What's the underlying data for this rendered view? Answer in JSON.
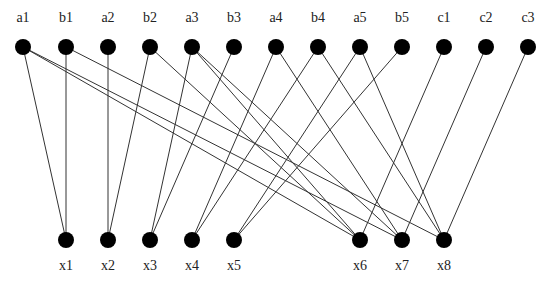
{
  "diagram": {
    "type": "bipartite-graph",
    "node_radius": 8,
    "colors": {
      "node": "#000000",
      "edge": "#333333",
      "label": "#222222",
      "background": "#ffffff"
    },
    "top_row": {
      "y": 47,
      "label_y": 22,
      "nodes": [
        {
          "id": "a1",
          "label": "a1",
          "x": 23
        },
        {
          "id": "b1",
          "label": "b1",
          "x": 66
        },
        {
          "id": "a2",
          "label": "a2",
          "x": 108
        },
        {
          "id": "b2",
          "label": "b2",
          "x": 150
        },
        {
          "id": "a3",
          "label": "a3",
          "x": 192
        },
        {
          "id": "b3",
          "label": "b3",
          "x": 234
        },
        {
          "id": "a4",
          "label": "a4",
          "x": 276
        },
        {
          "id": "b4",
          "label": "b4",
          "x": 318
        },
        {
          "id": "a5",
          "label": "a5",
          "x": 360
        },
        {
          "id": "b5",
          "label": "b5",
          "x": 402
        },
        {
          "id": "c1",
          "label": "c1",
          "x": 444
        },
        {
          "id": "c2",
          "label": "c2",
          "x": 486
        },
        {
          "id": "c3",
          "label": "c3",
          "x": 528
        }
      ]
    },
    "bottom_row": {
      "y": 240,
      "label_y": 270,
      "nodes": [
        {
          "id": "x1",
          "label": "x1",
          "x": 66
        },
        {
          "id": "x2",
          "label": "x2",
          "x": 108
        },
        {
          "id": "x3",
          "label": "x3",
          "x": 150
        },
        {
          "id": "x4",
          "label": "x4",
          "x": 192
        },
        {
          "id": "x5",
          "label": "x5",
          "x": 234
        },
        {
          "id": "x6",
          "label": "x6",
          "x": 360
        },
        {
          "id": "x7",
          "label": "x7",
          "x": 402
        },
        {
          "id": "x8",
          "label": "x8",
          "x": 444
        }
      ]
    },
    "edges": [
      [
        "a1",
        "x1"
      ],
      [
        "a1",
        "x6"
      ],
      [
        "a1",
        "x7"
      ],
      [
        "b1",
        "x1"
      ],
      [
        "b1",
        "x8"
      ],
      [
        "a2",
        "x2"
      ],
      [
        "b2",
        "x2"
      ],
      [
        "b2",
        "x6"
      ],
      [
        "a3",
        "x3"
      ],
      [
        "a3",
        "x6"
      ],
      [
        "a3",
        "x7"
      ],
      [
        "b3",
        "x3"
      ],
      [
        "a4",
        "x4"
      ],
      [
        "a4",
        "x7"
      ],
      [
        "b4",
        "x4"
      ],
      [
        "b4",
        "x8"
      ],
      [
        "a5",
        "x5"
      ],
      [
        "a5",
        "x8"
      ],
      [
        "b5",
        "x5"
      ],
      [
        "c1",
        "x6"
      ],
      [
        "c2",
        "x7"
      ],
      [
        "c3",
        "x8"
      ]
    ]
  }
}
